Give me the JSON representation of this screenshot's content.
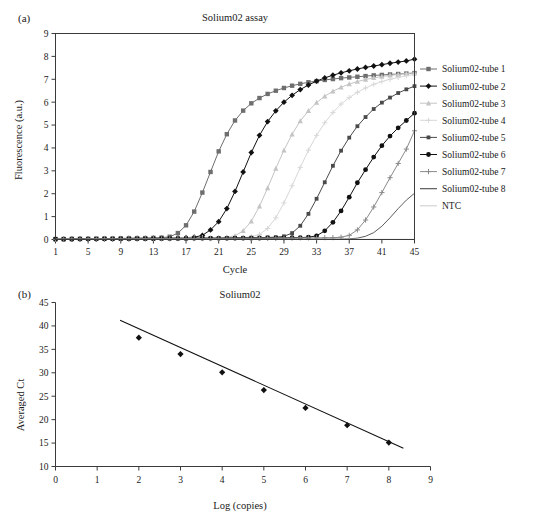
{
  "figure": {
    "panel_a_label": "(a)",
    "panel_b_label": "(b)"
  },
  "chart_data": [
    {
      "id": "amplification",
      "type": "line",
      "title": "Solium02 assay",
      "xlabel": "Cycle",
      "ylabel": "Fluorescence (a.u.)",
      "xlim": [
        1,
        45
      ],
      "ylim": [
        0,
        9
      ],
      "xticks": [
        1,
        5,
        9,
        13,
        17,
        21,
        25,
        29,
        33,
        37,
        41,
        45
      ],
      "yticks": [
        0,
        1,
        2,
        3,
        4,
        5,
        6,
        7,
        8,
        9
      ],
      "grid": false,
      "legend_position": "right",
      "x": [
        1,
        2,
        3,
        4,
        5,
        6,
        7,
        8,
        9,
        10,
        11,
        12,
        13,
        14,
        15,
        16,
        17,
        18,
        19,
        20,
        21,
        22,
        23,
        24,
        25,
        26,
        27,
        28,
        29,
        30,
        31,
        32,
        33,
        34,
        35,
        36,
        37,
        38,
        39,
        40,
        41,
        42,
        43,
        44,
        45
      ],
      "series": [
        {
          "name": "Solium02-tube 1",
          "marker": "square",
          "color": "#6e6e6e",
          "values": [
            0.02,
            0.02,
            0.03,
            0.03,
            0.03,
            0.04,
            0.04,
            0.04,
            0.05,
            0.05,
            0.06,
            0.06,
            0.07,
            0.08,
            0.12,
            0.28,
            0.62,
            1.22,
            2.05,
            2.95,
            3.85,
            4.6,
            5.2,
            5.63,
            5.95,
            6.18,
            6.36,
            6.5,
            6.62,
            6.72,
            6.8,
            6.87,
            6.92,
            6.97,
            7.01,
            7.05,
            7.08,
            7.11,
            7.14,
            7.17,
            7.19,
            7.21,
            7.23,
            7.25,
            7.27
          ]
        },
        {
          "name": "Solium02-tube 2",
          "marker": "diamond",
          "color": "#111111",
          "values": [
            0.02,
            0.02,
            0.02,
            0.03,
            0.03,
            0.03,
            0.04,
            0.04,
            0.04,
            0.05,
            0.05,
            0.05,
            0.06,
            0.06,
            0.07,
            0.07,
            0.08,
            0.1,
            0.18,
            0.42,
            0.78,
            1.35,
            2.1,
            2.95,
            3.8,
            4.55,
            5.15,
            5.62,
            6.0,
            6.3,
            6.55,
            6.75,
            6.92,
            7.06,
            7.18,
            7.28,
            7.37,
            7.45,
            7.52,
            7.58,
            7.64,
            7.7,
            7.75,
            7.8,
            7.88
          ]
        },
        {
          "name": "Solium02-tube 3",
          "marker": "triangle",
          "color": "#c4c4c4",
          "values": [
            0.02,
            0.02,
            0.02,
            0.02,
            0.03,
            0.03,
            0.03,
            0.03,
            0.04,
            0.04,
            0.04,
            0.05,
            0.05,
            0.05,
            0.06,
            0.06,
            0.06,
            0.07,
            0.07,
            0.08,
            0.08,
            0.1,
            0.16,
            0.38,
            0.8,
            1.45,
            2.25,
            3.1,
            3.9,
            4.6,
            5.18,
            5.62,
            5.98,
            6.26,
            6.48,
            6.65,
            6.79,
            6.9,
            6.99,
            7.06,
            7.12,
            7.17,
            7.21,
            7.25,
            7.28
          ]
        },
        {
          "name": "Solium02-tube 4",
          "marker": "cross-light",
          "color": "#d8d8d8",
          "values": [
            0.02,
            0.02,
            0.02,
            0.02,
            0.02,
            0.03,
            0.03,
            0.03,
            0.03,
            0.04,
            0.04,
            0.04,
            0.05,
            0.05,
            0.05,
            0.06,
            0.06,
            0.06,
            0.07,
            0.07,
            0.07,
            0.08,
            0.08,
            0.09,
            0.12,
            0.22,
            0.48,
            0.95,
            1.6,
            2.35,
            3.15,
            3.9,
            4.55,
            5.1,
            5.55,
            5.92,
            6.2,
            6.43,
            6.62,
            6.78,
            6.9,
            7.0,
            7.08,
            7.15,
            7.22
          ]
        },
        {
          "name": "Solium02-tube 5",
          "marker": "square-small",
          "color": "#4a4a4a",
          "values": [
            0.01,
            0.01,
            0.02,
            0.02,
            0.02,
            0.02,
            0.03,
            0.03,
            0.03,
            0.03,
            0.04,
            0.04,
            0.04,
            0.04,
            0.05,
            0.05,
            0.05,
            0.06,
            0.06,
            0.06,
            0.06,
            0.07,
            0.07,
            0.07,
            0.08,
            0.08,
            0.09,
            0.1,
            0.14,
            0.28,
            0.6,
            1.12,
            1.78,
            2.5,
            3.22,
            3.88,
            4.45,
            4.95,
            5.35,
            5.7,
            5.98,
            6.2,
            6.4,
            6.56,
            6.7
          ]
        },
        {
          "name": "Solium02-tube 6",
          "marker": "circle",
          "color": "#111111",
          "values": [
            0.01,
            0.01,
            0.01,
            0.02,
            0.02,
            0.02,
            0.02,
            0.02,
            0.03,
            0.03,
            0.03,
            0.03,
            0.03,
            0.04,
            0.04,
            0.04,
            0.04,
            0.05,
            0.05,
            0.05,
            0.05,
            0.05,
            0.06,
            0.06,
            0.06,
            0.06,
            0.07,
            0.07,
            0.07,
            0.08,
            0.08,
            0.1,
            0.16,
            0.38,
            0.75,
            1.25,
            1.85,
            2.48,
            3.05,
            3.6,
            4.1,
            4.52,
            4.88,
            5.2,
            5.52
          ]
        },
        {
          "name": "Solium02-tube 7",
          "marker": "plus",
          "color": "#8a8a8a",
          "values": [
            0.01,
            0.01,
            0.01,
            0.01,
            0.02,
            0.02,
            0.02,
            0.02,
            0.02,
            0.02,
            0.03,
            0.03,
            0.03,
            0.03,
            0.03,
            0.04,
            0.04,
            0.04,
            0.04,
            0.04,
            0.05,
            0.05,
            0.05,
            0.05,
            0.05,
            0.06,
            0.06,
            0.06,
            0.06,
            0.06,
            0.07,
            0.07,
            0.07,
            0.08,
            0.08,
            0.1,
            0.18,
            0.42,
            0.85,
            1.42,
            2.05,
            2.7,
            3.32,
            3.95,
            4.75
          ]
        },
        {
          "name": "Solium02-tube 8",
          "marker": "none",
          "color": "#4a4a4a",
          "values": [
            0.01,
            0.01,
            0.01,
            0.01,
            0.01,
            0.01,
            0.02,
            0.02,
            0.02,
            0.02,
            0.02,
            0.02,
            0.02,
            0.02,
            0.02,
            0.03,
            0.03,
            0.03,
            0.03,
            0.03,
            0.03,
            0.03,
            0.03,
            0.03,
            0.03,
            0.03,
            0.03,
            0.03,
            0.02,
            0.02,
            0.02,
            0.02,
            0.02,
            0.02,
            0.02,
            0.02,
            0.03,
            0.06,
            0.14,
            0.3,
            0.58,
            0.95,
            1.35,
            1.72,
            2.02
          ]
        },
        {
          "name": "NTC",
          "marker": "none",
          "color": "#cfcfcf",
          "values": [
            0.01,
            0.01,
            0.01,
            0.01,
            0.01,
            0.01,
            0.01,
            0.01,
            0.01,
            0.01,
            0.01,
            0.01,
            0.01,
            0.01,
            0.01,
            0.01,
            0.01,
            0.01,
            0.01,
            0.01,
            0.01,
            0.01,
            0.01,
            0.01,
            0.01,
            0.01,
            0.01,
            0.01,
            0.01,
            0.01,
            0.01,
            0.01,
            0.01,
            0.01,
            0.01,
            0.01,
            0.01,
            0.01,
            0.01,
            0.01,
            0.01,
            0.01,
            0.01,
            0.01,
            0.01
          ]
        }
      ]
    },
    {
      "id": "standard-curve",
      "type": "scatter",
      "title": "Solium02",
      "xlabel": "Log (copies)",
      "ylabel": "Averaged Ct",
      "xlim": [
        0,
        9
      ],
      "ylim": [
        10,
        45
      ],
      "xticks": [
        0,
        1,
        2,
        3,
        4,
        5,
        6,
        7,
        8,
        9
      ],
      "yticks": [
        10,
        15,
        20,
        25,
        30,
        35,
        40,
        45
      ],
      "grid": false,
      "marker": "diamond",
      "color": "#111111",
      "x": [
        2,
        3,
        4,
        5,
        6,
        7,
        8
      ],
      "values": [
        37.5,
        34.0,
        30.1,
        26.3,
        22.5,
        18.8,
        15.1
      ],
      "fit_line": {
        "x": [
          1.55,
          8.35
        ],
        "y": [
          41.2,
          13.9
        ]
      }
    }
  ]
}
